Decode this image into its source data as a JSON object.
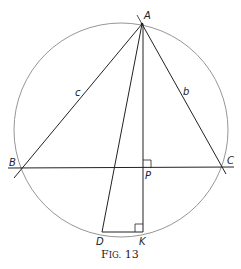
{
  "figure": {
    "caption": {
      "prefix_big": "F",
      "prefix_small": "IG.",
      "number": "13",
      "full": "FIG. 13"
    },
    "points": {
      "A": {
        "label": "A",
        "x": 142,
        "y": 24
      },
      "B": {
        "label": "B",
        "x": 22,
        "y": 168
      },
      "C": {
        "label": "C",
        "x": 221,
        "y": 167
      },
      "P": {
        "label": "P",
        "x": 143,
        "y": 168
      },
      "D": {
        "label": "D",
        "x": 102,
        "y": 232
      },
      "K": {
        "label": "K",
        "x": 143,
        "y": 232
      }
    },
    "sides": {
      "c": "c",
      "b": "b"
    },
    "circle": {
      "cx": 121,
      "cy": 130,
      "r": 107
    },
    "colors": {
      "line": "#222222",
      "circle": "#8a8a8a",
      "background": "#ffffff"
    }
  }
}
